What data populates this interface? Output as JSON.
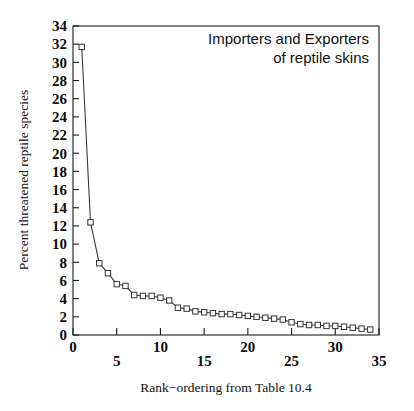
{
  "chart_data": {
    "type": "line",
    "title": "",
    "annotation": [
      "Importers and Exporters",
      "of reptile skins"
    ],
    "xlabel": "Rank−ordering from Table 10.4",
    "ylabel": "Percent threatened reptile species",
    "xlim": [
      0,
      35
    ],
    "ylim": [
      0,
      34
    ],
    "xticks": [
      0,
      5,
      10,
      15,
      20,
      25,
      30,
      35
    ],
    "xtick_labels": [
      "0",
      "5",
      "10",
      "15",
      "20",
      "25",
      "30",
      "35"
    ],
    "yticks": [
      0,
      2,
      4,
      6,
      8,
      10,
      12,
      14,
      16,
      18,
      20,
      22,
      24,
      26,
      28,
      30,
      32,
      34
    ],
    "ytick_labels": [
      "0",
      "2",
      "4",
      "6",
      "8",
      "10",
      "12",
      "14",
      "16",
      "18",
      "20",
      "22",
      "24",
      "26",
      "28",
      "30",
      "32",
      "34"
    ],
    "grid": false,
    "legend": null,
    "marker": "open-square",
    "line_color": "#333333",
    "marker_color": "#333333",
    "x": [
      1,
      2,
      3,
      4,
      5,
      6,
      7,
      8,
      9,
      10,
      11,
      12,
      13,
      14,
      15,
      16,
      17,
      18,
      19,
      20,
      21,
      22,
      23,
      24,
      25,
      26,
      27,
      28,
      29,
      30,
      31,
      32,
      33,
      34
    ],
    "values": [
      31.7,
      12.4,
      7.9,
      6.8,
      5.6,
      5.4,
      4.4,
      4.3,
      4.3,
      4.1,
      3.8,
      3.0,
      2.9,
      2.6,
      2.5,
      2.4,
      2.3,
      2.3,
      2.2,
      2.1,
      2.0,
      1.9,
      1.8,
      1.7,
      1.4,
      1.2,
      1.1,
      1.1,
      1.0,
      1.0,
      0.9,
      0.8,
      0.7,
      0.6
    ],
    "series": [
      {
        "name": "Percent threatened reptile species",
        "values": [
          31.7,
          12.4,
          7.9,
          6.8,
          5.6,
          5.4,
          4.4,
          4.3,
          4.3,
          4.1,
          3.8,
          3.0,
          2.9,
          2.6,
          2.5,
          2.4,
          2.3,
          2.3,
          2.2,
          2.1,
          2.0,
          1.9,
          1.8,
          1.7,
          1.4,
          1.2,
          1.1,
          1.1,
          1.0,
          1.0,
          0.9,
          0.8,
          0.7,
          0.6
        ]
      }
    ]
  }
}
